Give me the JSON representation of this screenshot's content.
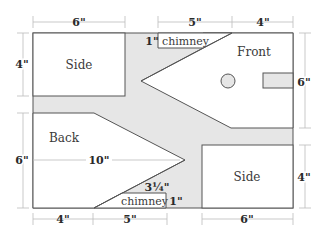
{
  "diagram": {
    "colors": {
      "background": "#ffffff",
      "scrap_fill": "#e6e6e6",
      "piece_fill": "#ffffff",
      "outline": "#555555",
      "dimension_line": "#bbbbbb",
      "text": "#3a3a3a"
    },
    "pieces": {
      "side_top": "Side",
      "front": "Front",
      "back": "Back",
      "side_bottom": "Side"
    },
    "chimney_labels": {
      "top": "chimney",
      "bottom": "chimney"
    },
    "dimensions": {
      "top": [
        "6\"",
        "5\"",
        "4\""
      ],
      "bottom": [
        "4\"",
        "5\"",
        "6\""
      ],
      "left": [
        "4\"",
        "6\""
      ],
      "right": [
        "6\"",
        "4\""
      ],
      "back_width": "10\"",
      "top_chimney_height": "1\"",
      "bottom_chimney_height": "1\"",
      "bottom_chimney_slope": "3¼\""
    }
  }
}
